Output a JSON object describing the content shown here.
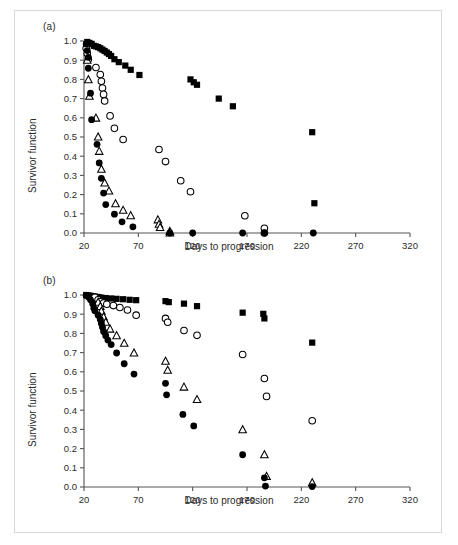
{
  "figure": {
    "background": "#ffffff",
    "border_color": "#d9d9d9",
    "ink_color": "#000000"
  },
  "panels": [
    {
      "id": "a",
      "label": "(a)"
    },
    {
      "id": "b",
      "label": "(b)"
    }
  ],
  "axes": {
    "xlabel": "Days to progression",
    "ylabel": "Survivor function",
    "xticks": [
      "20",
      "70",
      "120",
      "170",
      "220",
      "270",
      "320"
    ],
    "xtick_values": [
      20,
      70,
      120,
      170,
      220,
      270,
      320
    ],
    "xlim": [
      20,
      320
    ],
    "yticks": [
      "0.0",
      "0.1",
      "0.2",
      "0.3",
      "0.4",
      "0.5",
      "0.6",
      "0.7",
      "0.8",
      "0.9",
      "1.0"
    ],
    "ytick_values": [
      0.0,
      0.1,
      0.2,
      0.3,
      0.4,
      0.5,
      0.6,
      0.7,
      0.8,
      0.9,
      1.0
    ],
    "ylim": [
      0.0,
      1.0
    ],
    "grid": false,
    "legend": "none"
  },
  "chart_data": [
    {
      "type": "scatter",
      "panel": "(a)",
      "title": "",
      "xlabel": "Days to progression",
      "ylabel": "Survivor function",
      "xlim": [
        20,
        320
      ],
      "ylim": [
        0.0,
        1.0
      ],
      "grid": false,
      "legend_position": "none",
      "series": [
        {
          "name": "filled-square",
          "marker": "filled-square",
          "color": "#000000",
          "points": [
            [
              23,
              0.995
            ],
            [
              25,
              0.99
            ],
            [
              27,
              0.985
            ],
            [
              29,
              0.975
            ],
            [
              31,
              0.972
            ],
            [
              33,
              0.968
            ],
            [
              35,
              0.962
            ],
            [
              37,
              0.955
            ],
            [
              39,
              0.948
            ],
            [
              41,
              0.94
            ],
            [
              43,
              0.932
            ],
            [
              45,
              0.922
            ],
            [
              48,
              0.905
            ],
            [
              52,
              0.89
            ],
            [
              58,
              0.872
            ],
            [
              63,
              0.85
            ],
            [
              71,
              0.823
            ],
            [
              118,
              0.8
            ],
            [
              121,
              0.785
            ],
            [
              124,
              0.772
            ],
            [
              144,
              0.7
            ],
            [
              157,
              0.66
            ],
            [
              230,
              0.525
            ],
            [
              232,
              0.155
            ]
          ]
        },
        {
          "name": "open-circle",
          "marker": "open-circle",
          "color": "#000000",
          "points": [
            [
              22,
              0.962
            ],
            [
              23,
              0.935
            ],
            [
              24,
              0.905
            ],
            [
              31,
              0.862
            ],
            [
              35,
              0.825
            ],
            [
              36,
              0.79
            ],
            [
              37,
              0.755
            ],
            [
              38,
              0.722
            ],
            [
              39,
              0.688
            ],
            [
              44,
              0.61
            ],
            [
              48,
              0.545
            ],
            [
              56,
              0.487
            ],
            [
              89,
              0.435
            ],
            [
              95,
              0.372
            ],
            [
              109,
              0.272
            ],
            [
              118,
              0.215
            ],
            [
              168,
              0.09
            ],
            [
              186,
              0.025
            ],
            [
              186,
              0.0
            ]
          ]
        },
        {
          "name": "open-triangle",
          "marker": "open-triangle",
          "color": "#000000",
          "points": [
            [
              23,
              0.9
            ],
            [
              24,
              0.798
            ],
            [
              25,
              0.712
            ],
            [
              31,
              0.598
            ],
            [
              33,
              0.5
            ],
            [
              34,
              0.425
            ],
            [
              36,
              0.332
            ],
            [
              39,
              0.26
            ],
            [
              43,
              0.218
            ],
            [
              49,
              0.152
            ],
            [
              56,
              0.118
            ],
            [
              63,
              0.09
            ],
            [
              88,
              0.068
            ],
            [
              89,
              0.045
            ],
            [
              90,
              0.028
            ],
            [
              99,
              0.008
            ],
            [
              99,
              0.0
            ]
          ]
        },
        {
          "name": "filled-circle",
          "marker": "filled-circle",
          "color": "#000000",
          "points": [
            [
              22,
              0.985
            ],
            [
              23,
              0.95
            ],
            [
              24,
              0.915
            ],
            [
              24,
              0.858
            ],
            [
              26,
              0.728
            ],
            [
              27,
              0.59
            ],
            [
              32,
              0.462
            ],
            [
              34,
              0.365
            ],
            [
              36,
              0.285
            ],
            [
              38,
              0.208
            ],
            [
              40,
              0.148
            ],
            [
              48,
              0.098
            ],
            [
              55,
              0.058
            ],
            [
              65,
              0.032
            ],
            [
              99,
              0.0
            ],
            [
              120,
              0.0
            ],
            [
              166,
              0.0
            ],
            [
              186,
              0.0
            ],
            [
              231,
              0.0
            ]
          ]
        }
      ]
    },
    {
      "type": "scatter",
      "panel": "(b)",
      "title": "",
      "xlabel": "Days to progression",
      "ylabel": "Survivor function",
      "xlim": [
        20,
        320
      ],
      "ylim": [
        0.0,
        1.0
      ],
      "grid": false,
      "legend_position": "none",
      "series": [
        {
          "name": "filled-square",
          "marker": "filled-square",
          "color": "#000000",
          "points": [
            [
              22,
              1.0
            ],
            [
              24,
              0.998
            ],
            [
              26,
              0.996
            ],
            [
              28,
              0.994
            ],
            [
              30,
              0.992
            ],
            [
              32,
              0.99
            ],
            [
              34,
              0.988
            ],
            [
              36,
              0.986
            ],
            [
              40,
              0.984
            ],
            [
              45,
              0.982
            ],
            [
              50,
              0.98
            ],
            [
              56,
              0.978
            ],
            [
              62,
              0.975
            ],
            [
              68,
              0.973
            ],
            [
              95,
              0.968
            ],
            [
              98,
              0.963
            ],
            [
              112,
              0.955
            ],
            [
              124,
              0.942
            ],
            [
              166,
              0.908
            ],
            [
              185,
              0.902
            ],
            [
              186,
              0.878
            ],
            [
              230,
              0.752
            ]
          ]
        },
        {
          "name": "open-circle",
          "marker": "open-circle",
          "color": "#000000",
          "points": [
            [
              30,
              0.988
            ],
            [
              33,
              0.975
            ],
            [
              35,
              0.965
            ],
            [
              38,
              0.958
            ],
            [
              41,
              0.952
            ],
            [
              47,
              0.945
            ],
            [
              53,
              0.935
            ],
            [
              60,
              0.922
            ],
            [
              68,
              0.895
            ],
            [
              95,
              0.878
            ],
            [
              97,
              0.858
            ],
            [
              112,
              0.815
            ],
            [
              124,
              0.79
            ],
            [
              166,
              0.69
            ],
            [
              186,
              0.565
            ],
            [
              188,
              0.472
            ],
            [
              230,
              0.345
            ]
          ]
        },
        {
          "name": "open-triangle",
          "marker": "open-triangle",
          "color": "#000000",
          "points": [
            [
              33,
              0.962
            ],
            [
              35,
              0.94
            ],
            [
              36,
              0.915
            ],
            [
              38,
              0.885
            ],
            [
              40,
              0.858
            ],
            [
              44,
              0.822
            ],
            [
              50,
              0.788
            ],
            [
              57,
              0.748
            ],
            [
              66,
              0.698
            ],
            [
              95,
              0.655
            ],
            [
              97,
              0.608
            ],
            [
              112,
              0.52
            ],
            [
              124,
              0.455
            ],
            [
              166,
              0.298
            ],
            [
              186,
              0.168
            ],
            [
              188,
              0.055
            ],
            [
              230,
              0.022
            ]
          ]
        },
        {
          "name": "filled-circle",
          "marker": "filled-circle",
          "color": "#000000",
          "points": [
            [
              22,
              0.998
            ],
            [
              24,
              0.99
            ],
            [
              26,
              0.975
            ],
            [
              28,
              0.955
            ],
            [
              29,
              0.932
            ],
            [
              30,
              0.918
            ],
            [
              33,
              0.895
            ],
            [
              35,
              0.872
            ],
            [
              36,
              0.852
            ],
            [
              37,
              0.832
            ],
            [
              38,
              0.81
            ],
            [
              40,
              0.788
            ],
            [
              42,
              0.765
            ],
            [
              45,
              0.742
            ],
            [
              50,
              0.698
            ],
            [
              57,
              0.642
            ],
            [
              66,
              0.588
            ],
            [
              95,
              0.54
            ],
            [
              96,
              0.48
            ],
            [
              111,
              0.378
            ],
            [
              121,
              0.318
            ],
            [
              166,
              0.168
            ],
            [
              186,
              0.048
            ],
            [
              187,
              0.005
            ],
            [
              230,
              0.002
            ]
          ]
        }
      ]
    }
  ]
}
